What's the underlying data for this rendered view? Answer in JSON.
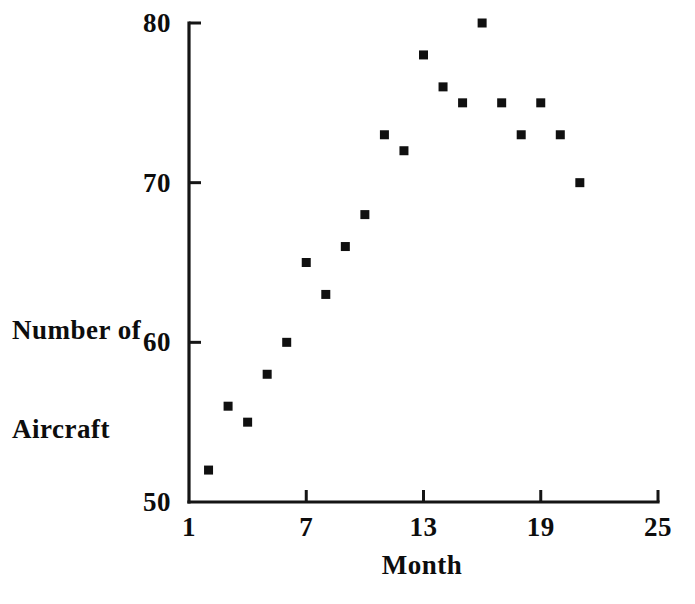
{
  "chart_data": {
    "type": "scatter",
    "title": "",
    "xlabel": "Month",
    "ylabel": "Number of\nAircraft",
    "ylabel_line1": "Number of",
    "ylabel_line2": "Aircraft",
    "xlim": [
      1,
      25
    ],
    "ylim": [
      50,
      80
    ],
    "xticks": [
      1,
      7,
      13,
      19,
      25
    ],
    "xtick_labels": [
      "1",
      "7",
      "13",
      "19",
      "25"
    ],
    "yticks": [
      50,
      60,
      70,
      80
    ],
    "ytick_labels": [
      "50",
      "60",
      "70",
      "80"
    ],
    "grid": false,
    "legend": null,
    "marker": "square",
    "marker_color": "#101010",
    "axis_color": "#151515",
    "background_color": "#ffffff",
    "x": [
      2,
      3,
      4,
      5,
      6,
      7,
      8,
      9,
      10,
      11,
      12,
      13,
      14,
      15,
      16,
      17,
      18,
      19,
      20,
      21
    ],
    "y": [
      52,
      56,
      55,
      58,
      60,
      65,
      63,
      66,
      68,
      73,
      72,
      78,
      76,
      75,
      80,
      75,
      73,
      75,
      73,
      70
    ],
    "points": [
      {
        "month": 2,
        "aircraft": 52
      },
      {
        "month": 3,
        "aircraft": 56
      },
      {
        "month": 4,
        "aircraft": 55
      },
      {
        "month": 5,
        "aircraft": 58
      },
      {
        "month": 6,
        "aircraft": 60
      },
      {
        "month": 7,
        "aircraft": 65
      },
      {
        "month": 8,
        "aircraft": 63
      },
      {
        "month": 9,
        "aircraft": 66
      },
      {
        "month": 10,
        "aircraft": 68
      },
      {
        "month": 11,
        "aircraft": 73
      },
      {
        "month": 12,
        "aircraft": 72
      },
      {
        "month": 13,
        "aircraft": 78
      },
      {
        "month": 14,
        "aircraft": 76
      },
      {
        "month": 15,
        "aircraft": 75
      },
      {
        "month": 16,
        "aircraft": 80
      },
      {
        "month": 17,
        "aircraft": 75
      },
      {
        "month": 18,
        "aircraft": 73
      },
      {
        "month": 19,
        "aircraft": 75
      },
      {
        "month": 20,
        "aircraft": 73
      },
      {
        "month": 21,
        "aircraft": 70
      }
    ]
  },
  "geometry": {
    "plot_left": 189,
    "plot_right": 658,
    "plot_top": 23,
    "plot_bottom": 502,
    "marker_size": 9,
    "tick_len": 12
  }
}
